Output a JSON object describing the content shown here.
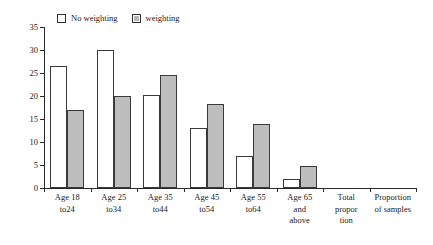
{
  "chart_data": {
    "type": "bar",
    "title": "",
    "subtitle": "",
    "xlabel": "",
    "ylabel": "",
    "ylim": [
      0,
      35
    ],
    "yticks": [
      0,
      5,
      10,
      15,
      20,
      25,
      30,
      35
    ],
    "ytick_labels": [
      "0",
      "5",
      "10",
      "15",
      "20",
      "25",
      "30",
      "35"
    ],
    "grid": false,
    "legend_position": "top-left",
    "categories": [
      "Age 18 to24",
      "Age 25 to34",
      "Age 35 to44",
      "Age 45 to54",
      "Age 55 to64",
      "Age 65 and above",
      "Total proportion",
      "Proportion of samples"
    ],
    "category_lines": [
      [
        "Age 18",
        "to24"
      ],
      [
        "Age 25",
        "to34"
      ],
      [
        "Age 35",
        "to44"
      ],
      [
        "Age 45",
        "to54"
      ],
      [
        "Age 55",
        "to64"
      ],
      [
        "Age 65",
        "and",
        "above"
      ],
      [
        "Total",
        "propor",
        "tion"
      ],
      [
        "Proportion",
        "of samples"
      ]
    ],
    "series": [
      {
        "name": "No weighting",
        "color": "#ffffff",
        "values": [
          26.5,
          30.0,
          20.3,
          13.0,
          6.9,
          2.0,
          null,
          null
        ]
      },
      {
        "name": "weighting",
        "color": "#bdbdbd",
        "values": [
          17.0,
          20.0,
          24.6,
          18.3,
          13.9,
          4.7,
          null,
          null
        ]
      }
    ]
  },
  "legend": {
    "entries": [
      {
        "label": "No weighting",
        "swatch": "hollow"
      },
      {
        "label": "weighting",
        "swatch": "filled"
      }
    ]
  }
}
